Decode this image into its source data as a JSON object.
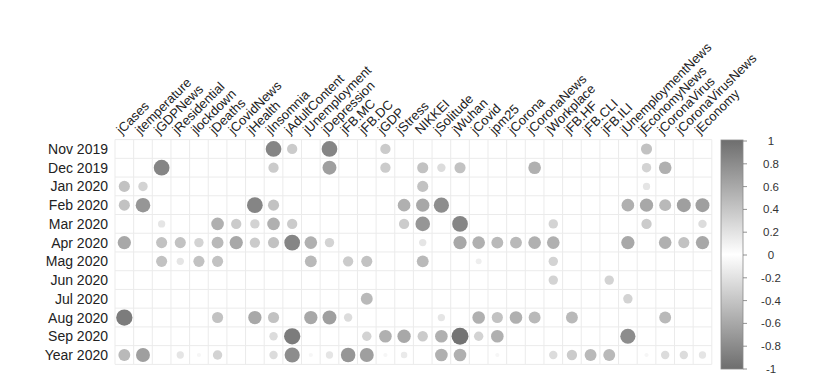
{
  "chart_data": {
    "type": "heatmap",
    "style": "correlation circle plot (circle size and grey shade encode magnitude)",
    "title": "",
    "xlabel": "",
    "ylabel": "",
    "legend_position": "right",
    "grid": true,
    "rows": [
      "Nov 2019",
      "Dec 2019",
      "Jan 2020",
      "Feb 2020",
      "Mar 2020",
      "Apr 2020",
      "Mag 2020",
      "Jun 2020",
      "Jul 2020",
      "Aug 2020",
      "Sep 2020",
      "Year 2020"
    ],
    "columns": [
      "jCases",
      "jtemperature",
      "jGDPNews",
      "jResidential",
      "jlockdown",
      "jDeaths",
      "jCovidNews",
      "jHealth",
      "jInsomnia",
      "jAdultContent",
      "jUnemployment",
      "jDepression",
      "jFB.MC",
      "jFB.DC",
      "jGDP",
      "jStress",
      "NIKKEI",
      "jSolitude",
      "jWuhan",
      "jCovid",
      "jpm25",
      "jCorona",
      "jCoronaNews",
      "jWorkplace",
      "jFB.HF",
      "jFB.CLI",
      "jFB.ILI",
      "jUnemploymentNews",
      "jEconomyNews",
      "jCoronaVirus",
      "jCoronaVirusNews",
      "jEconomy"
    ],
    "values": [
      [
        0,
        0,
        0,
        0,
        0,
        0,
        0,
        0,
        0.7,
        0.3,
        0,
        0.7,
        0,
        0,
        0.3,
        0,
        0,
        0,
        0,
        0,
        0,
        0,
        0,
        0,
        0,
        0,
        0,
        0,
        0.35,
        0,
        0,
        0
      ],
      [
        0,
        0,
        0.7,
        0,
        0,
        0,
        0,
        0,
        0.3,
        0,
        0,
        0.55,
        0,
        0,
        0.3,
        0,
        0.35,
        0.2,
        0.35,
        0,
        0,
        0,
        0.45,
        0,
        0,
        0,
        0,
        0,
        0.25,
        0.45,
        0,
        0
      ],
      [
        0.35,
        0.25,
        0,
        0,
        0,
        0,
        0,
        0,
        0,
        0,
        0,
        0,
        0,
        0,
        0,
        0,
        0.35,
        0,
        0,
        0,
        0,
        0,
        0,
        0,
        0,
        0,
        0,
        0,
        0.15,
        0,
        0,
        0
      ],
      [
        0.35,
        0.6,
        0,
        0,
        0,
        0,
        0,
        0.7,
        0.35,
        0,
        0,
        0,
        0,
        0,
        0,
        0.45,
        0.5,
        0.65,
        0,
        0,
        0,
        0,
        0,
        0,
        0,
        0,
        0,
        0.45,
        0.5,
        0.4,
        0.55,
        0.55
      ],
      [
        0,
        0,
        0.15,
        0,
        0,
        0.45,
        0.3,
        0.25,
        0.45,
        0.3,
        0,
        0,
        0,
        0,
        0,
        0.3,
        0.6,
        0,
        0.7,
        0,
        0,
        0,
        0,
        0.25,
        0,
        0,
        0,
        0,
        0.3,
        0,
        0,
        0.2
      ],
      [
        0.5,
        0,
        0.35,
        0.35,
        0.25,
        0.4,
        0.5,
        0.3,
        0.35,
        0.7,
        0.45,
        0.25,
        0,
        0,
        0,
        0,
        0.15,
        0,
        0.5,
        0.45,
        0.4,
        0.4,
        0.45,
        0.45,
        0,
        0,
        0,
        0.5,
        0,
        0.45,
        0.35,
        0.5
      ],
      [
        0,
        0,
        0.35,
        0.15,
        0.35,
        0.35,
        0,
        0,
        0,
        0,
        0.4,
        0,
        0.3,
        0.35,
        0,
        0,
        0.4,
        0,
        0,
        0.1,
        0,
        0,
        0,
        0.25,
        0,
        0,
        0,
        0,
        0,
        0,
        0,
        0
      ],
      [
        0,
        0,
        0,
        0,
        0,
        0,
        0,
        0,
        0,
        0,
        0,
        0,
        0,
        0,
        0,
        0,
        0,
        0,
        0,
        0,
        0,
        0,
        0,
        0.25,
        0,
        0,
        0.25,
        0,
        0,
        0,
        0,
        0
      ],
      [
        0,
        0,
        0,
        0,
        0,
        0,
        0,
        0,
        0,
        0,
        0,
        0,
        0,
        0.4,
        0,
        0,
        0,
        0,
        0,
        0,
        0,
        0,
        0,
        0,
        0,
        0,
        0,
        0.25,
        0,
        0,
        0,
        0
      ],
      [
        0.75,
        0,
        0,
        0,
        0,
        0.35,
        0,
        0.5,
        0.35,
        0,
        0.5,
        0.55,
        0.2,
        0,
        0,
        0,
        0,
        0.15,
        0,
        0.45,
        0.35,
        0.45,
        0.4,
        0,
        0.4,
        0,
        0,
        0,
        0,
        0.4,
        0,
        0
      ],
      [
        0,
        0,
        0,
        0,
        0,
        0,
        0,
        0,
        0.2,
        0.75,
        0,
        0,
        0,
        0.25,
        0.45,
        0.5,
        0.3,
        0.45,
        0.8,
        0.25,
        0.45,
        0,
        0,
        0,
        0,
        0,
        0,
        0.65,
        0,
        0,
        0,
        0
      ],
      [
        0.4,
        0.55,
        0,
        0.15,
        0.05,
        0.25,
        0,
        0,
        0.2,
        0.65,
        0.05,
        0.15,
        0.6,
        0.55,
        0.05,
        0.12,
        0,
        0.45,
        0.45,
        0,
        0.05,
        0,
        0,
        0.2,
        0.3,
        0.4,
        0.4,
        0,
        0.05,
        0.2,
        0.2,
        0.15
      ]
    ],
    "colorbar": {
      "min": -1,
      "max": 1,
      "ticks": [
        "1",
        "0.8",
        "0.6",
        "0.4",
        "0.2",
        "0",
        "-0.2",
        "-0.4",
        "-0.6",
        "-0.8",
        "-1"
      ]
    },
    "colors": {
      "extreme": "#6e6e6e",
      "zero": "#ffffff",
      "grid": "#ebebeb",
      "text": "#222222"
    }
  }
}
